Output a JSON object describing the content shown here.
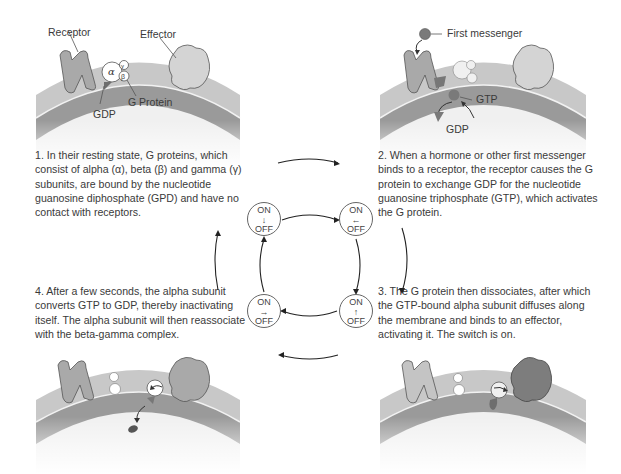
{
  "diagram": {
    "colors": {
      "membrane_outer": "#c8c8c8",
      "membrane_inner": "#9a9a9a",
      "receptor": "#a9a9a9",
      "effector_inactive": "#d4d4d4",
      "effector_active": "#7d7d7d",
      "nucleotide": "#6e6e6e",
      "text": "#3a3a3a"
    },
    "panels": [
      {
        "id": 1,
        "labels": {
          "receptor": "Receptor",
          "effector": "Effector",
          "g_protein": "G Protein",
          "gdp": "GDP",
          "alpha": "α",
          "beta": "β",
          "gamma": "γ"
        },
        "caption": "1. In their resting state, G proteins, which consist of alpha (α), beta (β) and gamma (γ) subunits, are bound by the nucleotide guanosine diphosphate (GPD) and have no contact with receptors."
      },
      {
        "id": 2,
        "labels": {
          "first_messenger": "First messenger",
          "gtp": "GTP",
          "gdp": "GDP"
        },
        "caption": "2. When a hormone or other first messenger binds to a receptor, the receptor causes the G protein to exchange GDP for the nucleotide guanosine triphosphate (GTP), which activates the G protein."
      },
      {
        "id": 3,
        "labels": {},
        "caption": "3. The G protein then dissociates, after which the GTP-bound alpha subunit diffuses along the membrane and binds to an effector, activating it. The switch is on."
      },
      {
        "id": 4,
        "labels": {},
        "caption": "4. After a few seconds, the alpha subunit converts GTP to GDP, thereby inactivating itself. The alpha subunit will then reassociate with the beta-gamma complex."
      }
    ],
    "switch_cycle": {
      "nodes": [
        {
          "position": "top-left",
          "on": "ON",
          "arrow": "↓",
          "off": "OFF"
        },
        {
          "position": "top-right",
          "on": "ON",
          "arrow": "←",
          "off": "OFF"
        },
        {
          "position": "bottom-right",
          "on": "ON",
          "arrow": "↑",
          "off": "OFF"
        },
        {
          "position": "bottom-left",
          "on": "ON",
          "arrow": "→",
          "off": "OFF"
        }
      ],
      "direction": "clockwise"
    }
  }
}
